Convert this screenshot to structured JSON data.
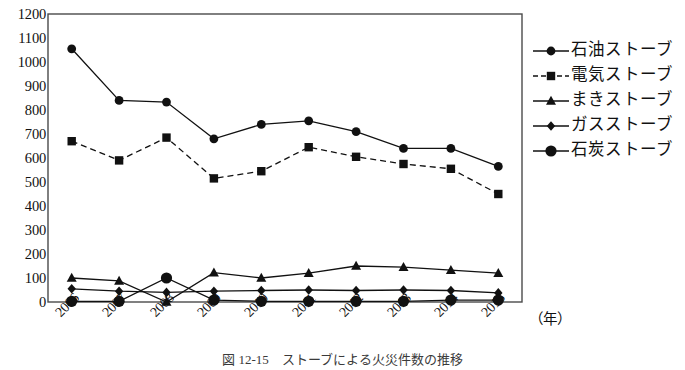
{
  "figure": {
    "caption": "図 12-15　ストーブによる火災件数の推移",
    "x_unit_label": "（年）"
  },
  "legend": {
    "position": "right",
    "items": [
      {
        "label": "石油ストーブ",
        "marker": "circle",
        "line": "solid",
        "name": "oil-stove"
      },
      {
        "label": "電気ストーブ",
        "marker": "square",
        "line": "dashed",
        "name": "electric-stove"
      },
      {
        "label": "まきストーブ",
        "marker": "triangle",
        "line": "solid",
        "name": "wood-stove"
      },
      {
        "label": "ガスストーブ",
        "marker": "diamond",
        "line": "solid",
        "name": "gas-stove"
      },
      {
        "label": "石炭ストーブ",
        "marker": "circle-large",
        "line": "solid",
        "name": "coal-stove"
      }
    ]
  },
  "axes": {
    "y_ticks": [
      1200,
      1100,
      1000,
      900,
      800,
      700,
      600,
      500,
      400,
      300,
      200,
      100,
      0
    ],
    "x_ticks": [
      "2006",
      "2007",
      "2008",
      "2009",
      "2010",
      "2011",
      "2012",
      "2013",
      "2014",
      "2015"
    ]
  },
  "colors": {
    "ink": "#111111",
    "frame": "#4a4a4a",
    "background": "#ffffff"
  },
  "chart_data": {
    "type": "line",
    "title": "図 12-15　ストーブによる火災件数の推移",
    "xlabel": "（年）",
    "ylabel": "",
    "categories": [
      "2006",
      "2007",
      "2008",
      "2009",
      "2010",
      "2011",
      "2012",
      "2013",
      "2014",
      "2015"
    ],
    "ylim": [
      0,
      1200
    ],
    "ytick_step": 100,
    "grid": false,
    "legend_position": "right",
    "series": [
      {
        "name": "石油ストーブ",
        "marker": "circle",
        "line": "solid",
        "values": [
          1055,
          840,
          833,
          680,
          740,
          755,
          710,
          640,
          640,
          565
        ]
      },
      {
        "name": "電気ストーブ",
        "marker": "square",
        "line": "dashed",
        "values": [
          670,
          590,
          685,
          515,
          545,
          645,
          605,
          575,
          555,
          450
        ]
      },
      {
        "name": "まきストーブ",
        "marker": "triangle",
        "line": "solid",
        "values": [
          100,
          88,
          0,
          122,
          100,
          120,
          150,
          145,
          133,
          120
        ]
      },
      {
        "name": "ガスストーブ",
        "marker": "diamond",
        "line": "solid",
        "values": [
          55,
          45,
          40,
          45,
          48,
          50,
          48,
          50,
          48,
          38
        ]
      },
      {
        "name": "石炭ストーブ",
        "marker": "circle-large",
        "line": "solid",
        "values": [
          3,
          3,
          100,
          8,
          3,
          3,
          3,
          3,
          8,
          8
        ]
      }
    ]
  }
}
